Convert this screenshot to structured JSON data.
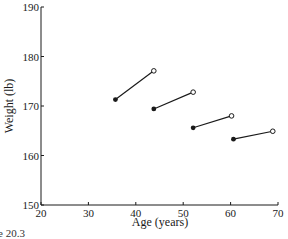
{
  "chart_data": {
    "type": "line",
    "title": "",
    "xlabel": "Age (years)",
    "ylabel": "Weight (lb)",
    "xlim": [
      20,
      70
    ],
    "ylim": [
      150,
      190
    ],
    "xticks": [
      20,
      30,
      40,
      50,
      60,
      70
    ],
    "yticks": [
      150,
      160,
      170,
      180,
      190
    ],
    "grid": false,
    "legend": null,
    "marker_legend": {
      "filled": "start of interval",
      "open": "end of interval"
    },
    "segments": [
      {
        "start": {
          "age": 35.7,
          "weight": 171.3
        },
        "end": {
          "age": 43.8,
          "weight": 177.1
        }
      },
      {
        "start": {
          "age": 43.8,
          "weight": 169.4
        },
        "end": {
          "age": 52.1,
          "weight": 172.8
        }
      },
      {
        "start": {
          "age": 52.1,
          "weight": 165.6
        },
        "end": {
          "age": 60.2,
          "weight": 168.0
        }
      },
      {
        "start": {
          "age": 60.6,
          "weight": 163.3
        },
        "end": {
          "age": 68.9,
          "weight": 164.9
        }
      }
    ]
  },
  "caption_fragment": "e 20.3",
  "colors": {
    "ink": "#1a1a1a",
    "background": "#ffffff"
  }
}
